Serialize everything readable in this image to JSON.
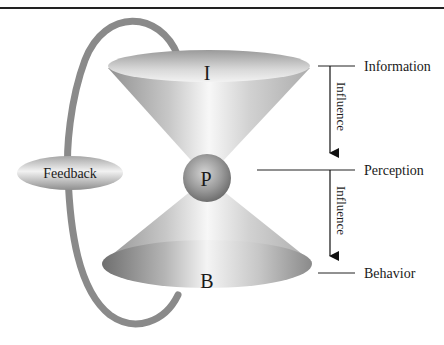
{
  "diagram": {
    "nodes": {
      "information_cone": {
        "label": "I"
      },
      "perception_sphere": {
        "label": "P"
      },
      "behavior_cone": {
        "label": "B"
      },
      "feedback": {
        "label": "Feedback"
      }
    },
    "levels": [
      {
        "label": "Information"
      },
      {
        "label": "Perception"
      },
      {
        "label": "Behavior"
      }
    ],
    "arrows": [
      {
        "label": "Influence",
        "from": "Information",
        "to": "Perception"
      },
      {
        "label": "Influence",
        "from": "Perception",
        "to": "Behavior"
      }
    ],
    "colors": {
      "loop": "#8a8a8a",
      "rule": "#222222",
      "text": "#1a1a1a"
    }
  }
}
